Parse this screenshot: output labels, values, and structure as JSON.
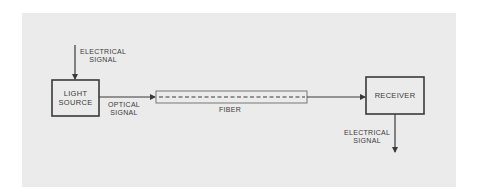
{
  "diagram": {
    "type": "block-diagram",
    "colors": {
      "panel_background": "#ebebeb",
      "line": "#3a3a3a",
      "fiber_outline": "#6a6a6a"
    },
    "input": {
      "line1": "ELECTRICAL",
      "line2": "SIGNAL"
    },
    "light_source": {
      "line1": "LIGHT",
      "line2": "SOURCE"
    },
    "optical_signal": {
      "line1": "OPTICAL",
      "line2": "SIGNAL"
    },
    "fiber": {
      "label": "FIBER"
    },
    "receiver": {
      "label": "RECEIVER"
    },
    "output": {
      "line1": "ELECTRICAL",
      "line2": "SIGNAL"
    },
    "flow": [
      "ELECTRICAL SIGNAL",
      "LIGHT SOURCE",
      "OPTICAL SIGNAL",
      "FIBER",
      "RECEIVER",
      "ELECTRICAL SIGNAL"
    ]
  }
}
